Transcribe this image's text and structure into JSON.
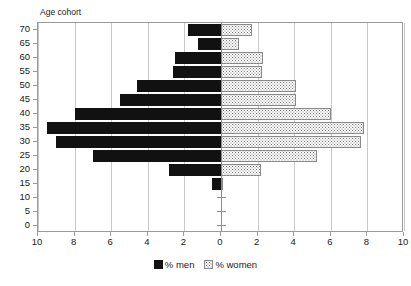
{
  "chart_data": {
    "type": "bar",
    "subtype": "population-pyramid",
    "title": "",
    "axis_title": "Age cohort",
    "xlabel": "",
    "ylabel": "Age cohort",
    "categories": [
      "70",
      "65",
      "60",
      "55",
      "50",
      "45",
      "40",
      "35",
      "30",
      "25",
      "20",
      "15",
      "10",
      "5",
      "0"
    ],
    "x_ticks": [
      "10",
      "8",
      "6",
      "4",
      "2",
      "0",
      "2",
      "4",
      "6",
      "8",
      "10"
    ],
    "x_tick_values": [
      -10,
      -8,
      -6,
      -4,
      -2,
      0,
      2,
      4,
      6,
      8,
      10
    ],
    "xlim": [
      -10,
      10
    ],
    "grid": true,
    "legend_position": "bottom",
    "series": [
      {
        "name": "% men",
        "direction": "left",
        "color": "#111111",
        "fill": "solid",
        "values": [
          1.8,
          1.25,
          2.5,
          2.6,
          4.6,
          5.5,
          8.0,
          9.5,
          9.0,
          7.0,
          2.85,
          0.5,
          0.0,
          0.0,
          0.0
        ]
      },
      {
        "name": "% women",
        "direction": "right",
        "color": "#7a7a7a",
        "fill": "stipple",
        "values": [
          1.7,
          1.0,
          2.3,
          2.25,
          4.1,
          4.1,
          6.0,
          7.8,
          7.65,
          5.25,
          2.2,
          0.1,
          0.0,
          0.0,
          0.0
        ]
      }
    ]
  },
  "legend": {
    "men_label": "% men",
    "women_label": "% women"
  },
  "colors": {
    "men": "#111111",
    "women": "#7a7a7a",
    "grid": "#c9c9c9",
    "axis": "#9a9a9a",
    "background": "#ffffff"
  }
}
